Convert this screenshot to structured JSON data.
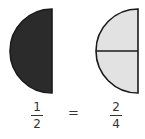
{
  "diagram": {
    "left_shape": {
      "description": "half circle fully shaded",
      "fill": "#2b2b2b",
      "stroke": "#1a1a1a"
    },
    "right_shape": {
      "description": "half circle divided into two quarters, both shaded light",
      "fill": "#e2e2e2",
      "stroke": "#1a1a1a"
    },
    "left_fraction": {
      "numerator": "1",
      "denominator": "2"
    },
    "equals": "=",
    "right_fraction": {
      "numerator": "2",
      "denominator": "4"
    }
  }
}
